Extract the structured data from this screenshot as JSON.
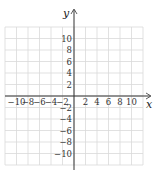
{
  "figure": {
    "type": "coordinate-grid",
    "x_axis_label": "x",
    "y_axis_label": "y",
    "x_ticks": [
      "-10",
      "-8",
      "-6",
      "-4",
      "-2",
      "2",
      "4",
      "6",
      "8",
      "10"
    ],
    "y_ticks": [
      "10",
      "8",
      "6",
      "4",
      "2",
      "-2",
      "-4",
      "-6",
      "-8",
      "-10"
    ],
    "x_range": [
      -12,
      12
    ],
    "y_range": [
      -12,
      12
    ],
    "grid_step": 2,
    "colors": {
      "grid": "#d9d9d9",
      "axis": "#333333",
      "text": "#333333"
    }
  }
}
